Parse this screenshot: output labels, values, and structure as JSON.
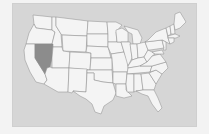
{
  "map": {
    "title": "United States",
    "highlighted_state": "Nevada",
    "colors": {
      "background": "#f3f3f3",
      "panel": "#d6d6d6",
      "state_fill": "#f4f4f4",
      "state_border": "#8a8a8a",
      "highlight_fill": "#8c8c8c"
    }
  }
}
